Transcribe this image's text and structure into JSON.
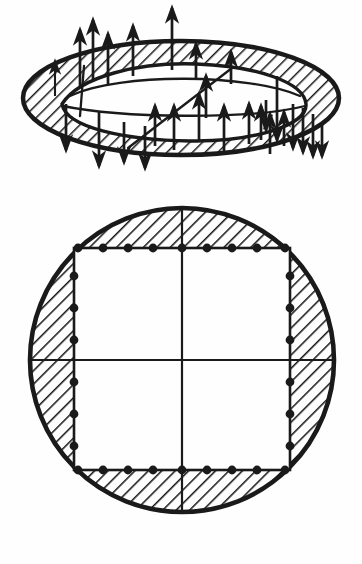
{
  "figure": {
    "type": "engineering-diagram",
    "ink_color": "#1a1a1a",
    "paper_color": "#fefefe",
    "views": [
      {
        "id": "perspective-view",
        "label": "Perspective view of annular plate with distributed edge loading",
        "position": "top",
        "shape": "ellipse-annulus",
        "ellipse": {
          "cx": 181,
          "cy": 98,
          "rx": 158,
          "ry": 57,
          "inner_rx": 118,
          "inner_ry": 38
        },
        "inner_outline": "parallelogram",
        "parallelogram": {
          "points": "78,100 146,73 286,78 214,112"
        },
        "diagonal": {
          "x1": 128,
          "y1": 148,
          "x2": 228,
          "y2": 70
        },
        "mid_chord": {
          "x1": 52,
          "y1": 116,
          "x2": 300,
          "y2": 112
        }
      },
      {
        "id": "plan-view",
        "label": "Plan view: circle with inscribed square and edge support points",
        "position": "bottom",
        "shape": "circle-annulus",
        "circle": {
          "cx": 182,
          "cy": 360,
          "r": 154
        },
        "square": {
          "x": 74,
          "y": 248,
          "w": 216,
          "h": 222
        },
        "axes": {
          "vertical_x": 182,
          "horizontal_y": 360
        }
      }
    ],
    "hatching": {
      "pattern": "diagonal-45",
      "spacing_px": 9,
      "stroke_width": 2.4
    },
    "arrows": {
      "legend": "Vertical load vectors normal to plate surface",
      "up_count": 20,
      "down_count": 12,
      "total": 32,
      "items": [
        {
          "x": 55,
          "base": 96,
          "len": 34,
          "dir": "up",
          "head": "small"
        },
        {
          "x": 66,
          "base": 104,
          "len": 46,
          "dir": "down"
        },
        {
          "x": 80,
          "base": 86,
          "len": 56,
          "dir": "up"
        },
        {
          "x": 93,
          "base": 80,
          "len": 60,
          "dir": "up"
        },
        {
          "x": 99,
          "base": 112,
          "len": 54,
          "dir": "down"
        },
        {
          "x": 108,
          "base": 84,
          "len": 50,
          "dir": "up"
        },
        {
          "x": 124,
          "base": 122,
          "len": 40,
          "dir": "down"
        },
        {
          "x": 133,
          "base": 76,
          "len": 50,
          "dir": "up"
        },
        {
          "x": 145,
          "base": 126,
          "len": 42,
          "dir": "down"
        },
        {
          "x": 155,
          "base": 146,
          "len": 40,
          "dir": "up"
        },
        {
          "x": 172,
          "base": 70,
          "len": 62,
          "dir": "up"
        },
        {
          "x": 174,
          "base": 150,
          "len": 44,
          "dir": "up"
        },
        {
          "x": 196,
          "base": 78,
          "len": 34,
          "dir": "up"
        },
        {
          "x": 199,
          "base": 142,
          "len": 48,
          "dir": "up"
        },
        {
          "x": 206,
          "base": 118,
          "len": 42,
          "dir": "up"
        },
        {
          "x": 224,
          "base": 152,
          "len": 46,
          "dir": "up"
        },
        {
          "x": 231,
          "base": 84,
          "len": 32,
          "dir": "up"
        },
        {
          "x": 249,
          "base": 144,
          "len": 40,
          "dir": "up"
        },
        {
          "x": 261,
          "base": 140,
          "len": 34,
          "dir": "up"
        },
        {
          "x": 266,
          "base": 100,
          "len": 30,
          "dir": "down"
        },
        {
          "x": 270,
          "base": 154,
          "len": 40,
          "dir": "up"
        },
        {
          "x": 277,
          "base": 76,
          "len": 64,
          "dir": "down"
        },
        {
          "x": 284,
          "base": 146,
          "len": 34,
          "dir": "up"
        },
        {
          "x": 293,
          "base": 104,
          "len": 44,
          "dir": "down"
        },
        {
          "x": 303,
          "base": 108,
          "len": 44,
          "dir": "down"
        },
        {
          "x": 313,
          "base": 114,
          "len": 42,
          "dir": "down"
        },
        {
          "x": 322,
          "base": 122,
          "len": 34,
          "dir": "down"
        }
      ]
    },
    "support_points": {
      "legend": "Discrete support / reaction points along square edges",
      "radius_px": 4.4,
      "top_edge": [
        78,
        103,
        128,
        153,
        182,
        207,
        232,
        257,
        285
      ],
      "bottom_edge": [
        78,
        103,
        128,
        153,
        182,
        207,
        232,
        257,
        285
      ],
      "left_edge": [
        276,
        308,
        340,
        382,
        414,
        446
      ],
      "right_edge": [
        276,
        308,
        340,
        382,
        414,
        446
      ]
    }
  }
}
